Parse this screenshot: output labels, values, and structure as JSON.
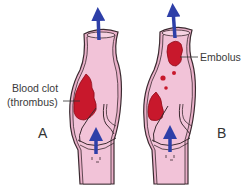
{
  "labels": {
    "clot_line1": "Blood clot",
    "clot_line2": "(thrombus)",
    "embolus": "Embolus",
    "panel_a": "A",
    "panel_b": "B"
  },
  "colors": {
    "vein_fill": "#efb8d0",
    "vein_inner": "#f3c6da",
    "vein_outline": "#3b2a30",
    "clot": "#c8182c",
    "clot_dark": "#9e0f20",
    "arrow": "#2e3fa8",
    "text": "#3a3a3a"
  }
}
